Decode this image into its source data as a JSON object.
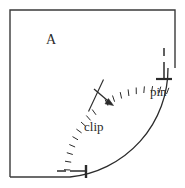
{
  "figure": {
    "background_color": "#ffffff",
    "stroke_color": "#2b2b2b",
    "border_color": "#3a3a3a",
    "labels": {
      "region": "A",
      "clip": "clip",
      "pin": "pin"
    },
    "boundary": {
      "type": "square",
      "left": 10,
      "top": 10,
      "right": 175,
      "bottom": 177
    },
    "arc": {
      "type": "quarter-circle",
      "center_x": 175,
      "center_y": 177,
      "radius": 109,
      "start_point": [
        70,
        177
      ],
      "end_point": [
        168,
        68
      ],
      "hatch_marks": 14,
      "hatch_length": 6,
      "hatch_side": "outer"
    },
    "arrow": {
      "name": "normal-direction-arrow",
      "from": [
        95,
        90
      ],
      "to": [
        113,
        105
      ],
      "cross_tick_from": [
        89,
        110
      ],
      "cross_tick_to": [
        103,
        80
      ]
    },
    "supports": [
      {
        "name": "pin-support",
        "symbol": "T",
        "x": 164,
        "y": 52,
        "stem_height": 20,
        "base_width": 14
      },
      {
        "name": "roller-support",
        "symbol": "T-rotated",
        "x": 86,
        "y": 171,
        "stem_length": 16,
        "base_height": 12
      }
    ],
    "dash_mark": {
      "name": "minus-tick",
      "from": [
        58,
        172
      ],
      "to": [
        68,
        172
      ]
    }
  }
}
